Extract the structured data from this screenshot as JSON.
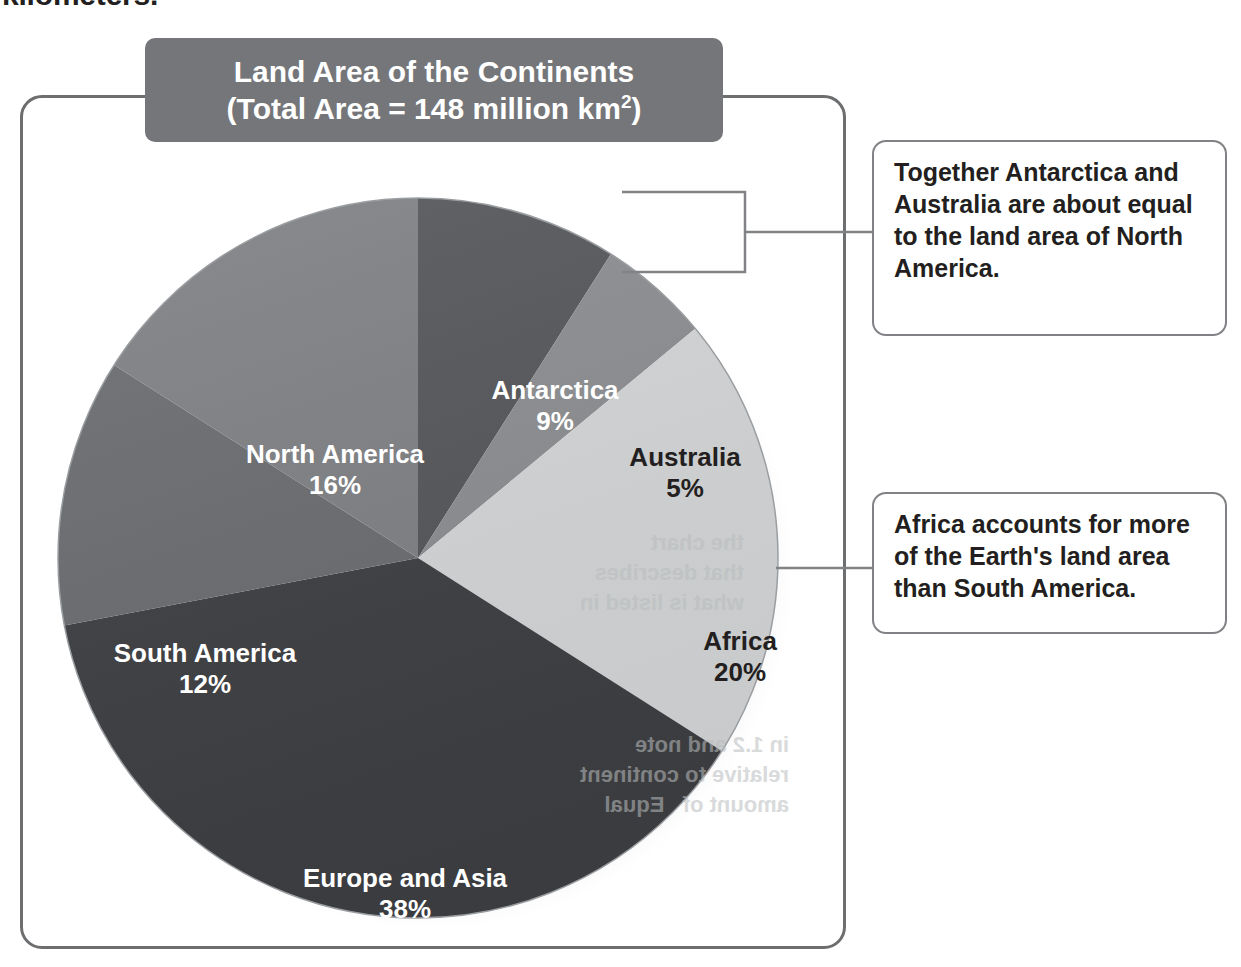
{
  "page": {
    "top_fragment": "kilometers."
  },
  "chart_data": {
    "type": "pie",
    "title_line1": "Land Area of the Continents",
    "title_line2_prefix": "(Total Area ",
    "title_line2_equals": "=",
    "title_line2_suffix": " 148 million km",
    "title_line2_sup": "2",
    "title_line2_close": ")",
    "title": "Land Area of the Continents (Total Area = 148 million km2)",
    "total_area_label": "148 million km2",
    "categories": [
      "Antarctica",
      "Australia",
      "Africa",
      "Europe and Asia",
      "South America",
      "North America"
    ],
    "values": [
      9,
      5,
      20,
      38,
      12,
      16
    ],
    "value_labels": [
      "9%",
      "5%",
      "20%",
      "38%",
      "12%",
      "16%"
    ],
    "colors": [
      "#55565a",
      "#8b8d90",
      "#d3d5d6",
      "#3e3f42",
      "#6a6c6f",
      "#7e8083"
    ],
    "label_colors": [
      "#ffffff",
      "#231f20",
      "#231f20",
      "#ffffff",
      "#ffffff",
      "#ffffff"
    ],
    "start_angle_deg": 0,
    "direction": "clockwise",
    "legend": "none",
    "grid": false,
    "slices": [
      {
        "name": "Antarctica",
        "percent": "9%",
        "label_fill": "light"
      },
      {
        "name": "Australia",
        "percent": "5%",
        "label_fill": "dark"
      },
      {
        "name": "Africa",
        "percent": "20%",
        "label_fill": "dark"
      },
      {
        "name": "Europe and Asia",
        "percent": "38%",
        "label_fill": "light"
      },
      {
        "name": "South America",
        "percent": "12%",
        "label_fill": "light"
      },
      {
        "name": "North America",
        "percent": "16%",
        "label_fill": "light"
      }
    ]
  },
  "callouts": [
    {
      "text": "Together Antarctica and Australia are about equal to the land area of North America."
    },
    {
      "text": "Africa accounts for more of the Earth's land area than South America."
    }
  ],
  "ghost_text": {
    "block_a": "the chart\nthat describes\nwhat is listed in",
    "block_b": "in 1.2 and note\nrelative to continent\namount of   Equal"
  }
}
